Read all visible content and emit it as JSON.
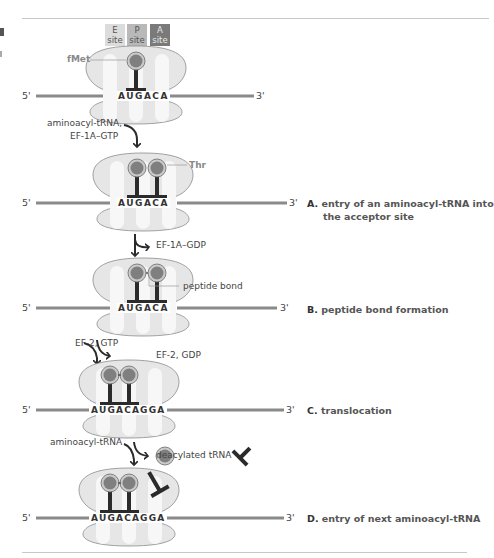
{
  "sites": [
    {
      "letter": "E",
      "word": "site",
      "color": "#dcdcdc",
      "text_color": "#555555"
    },
    {
      "letter": "P",
      "word": "site",
      "color": "#b9b9b9",
      "text_color": "#555555"
    },
    {
      "letter": "A",
      "word": "site",
      "color": "#7a7a7a",
      "text_color": "#e8e8e8"
    }
  ],
  "strand_ends": {
    "five": "5'",
    "three": "3'"
  },
  "labels": {
    "fmet": "fMet",
    "thr": "Thr",
    "peptide_bond": "peptide bond",
    "deacylated_trna": "deacylated tRNA"
  },
  "reactions": {
    "r1_line1": "aminoacyl-tRNA,",
    "r1_line2": "EF-1A–GTP",
    "r2_out": "EF-1A–GDP",
    "r3_in": "EF-2, GTP",
    "r3_out": "EF-2, GDP",
    "r4_in": "aminoacyl-tRNA"
  },
  "codons": {
    "stage1": "AUGACA",
    "stage2": "AUGACA",
    "stage3": "AUGACA",
    "stage4": "AUGACAGGA",
    "stage5": "AUGACAGGA"
  },
  "steps": [
    {
      "letter": "A.",
      "line1": "entry of an aminoacyl-tRNA into",
      "line2": "the acceptor site"
    },
    {
      "letter": "B.",
      "line1": "peptide bond formation"
    },
    {
      "letter": "C.",
      "line1": "translocation"
    },
    {
      "letter": "D.",
      "line1": "entry of next aminoacyl-tRNA"
    }
  ],
  "colors": {
    "ribosome_fill": "#e6e6e6",
    "ribosome_stroke": "#8c8c8c",
    "mrna": "#8a8a8a",
    "trna": "#2b2b2b",
    "amino_acid": "#7f7f7f",
    "rule": "#c8c8c8"
  }
}
